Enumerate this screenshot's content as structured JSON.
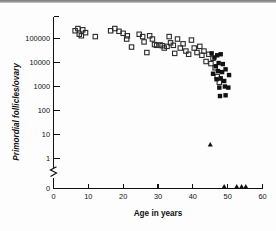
{
  "figure": {
    "background_color": "#fdfdfd",
    "ink_color": "#111111"
  },
  "chart_data": {
    "type": "scatter",
    "title": "",
    "xlabel": "Age in years",
    "ylabel": "Primordial follicles/ovary",
    "xlim": [
      0,
      60
    ],
    "ylim_log": [
      1,
      300000
    ],
    "yscale": "log",
    "grid": false,
    "legend": false,
    "axis_break": {
      "present": true,
      "between": [
        1,
        0
      ],
      "note": "y-axis broken below 1 to show a zero baseline"
    },
    "xticks": [
      0,
      10,
      20,
      30,
      40,
      50,
      60
    ],
    "xtick_labels": [
      "0",
      "10",
      "20",
      "30",
      "40",
      "50",
      "60"
    ],
    "yticks": [
      100000,
      10000,
      1000,
      100,
      10,
      1,
      0
    ],
    "ytick_labels": [
      "100000",
      "10000",
      "1000",
      "100",
      "10",
      "1",
      "0"
    ],
    "series": [
      {
        "name": "open-square",
        "marker": "open square",
        "marker_color": "#2b2b2b",
        "points": [
          [
            6.2,
            210000
          ],
          [
            7.4,
            150000
          ],
          [
            7.0,
            260000
          ],
          [
            8.4,
            230000
          ],
          [
            8.0,
            130000
          ],
          [
            9.2,
            175000
          ],
          [
            12.0,
            120000
          ],
          [
            16.4,
            210000
          ],
          [
            17.6,
            260000
          ],
          [
            18.8,
            200000
          ],
          [
            20.0,
            165000
          ],
          [
            21.2,
            130000
          ],
          [
            21.0,
            95000
          ],
          [
            22.4,
            44000
          ],
          [
            24.6,
            150000
          ],
          [
            25.6,
            120000
          ],
          [
            26.0,
            72000
          ],
          [
            26.8,
            26000
          ],
          [
            27.6,
            130000
          ],
          [
            28.4,
            95000
          ],
          [
            29.0,
            56000
          ],
          [
            29.6,
            52000
          ],
          [
            30.6,
            54000
          ],
          [
            31.2,
            50000
          ],
          [
            31.8,
            40000
          ],
          [
            32.6,
            47000
          ],
          [
            33.2,
            120000
          ],
          [
            33.6,
            66000
          ],
          [
            34.4,
            52000
          ],
          [
            34.8,
            24000
          ],
          [
            35.6,
            95000
          ],
          [
            36.4,
            40000
          ],
          [
            37.2,
            60000
          ],
          [
            38.0,
            30000
          ],
          [
            38.8,
            22000
          ],
          [
            39.6,
            86000
          ],
          [
            40.4,
            40000
          ],
          [
            41.2,
            26000
          ],
          [
            42.0,
            47000
          ],
          [
            42.6,
            20000
          ],
          [
            43.2,
            30000
          ],
          [
            43.8,
            11000
          ],
          [
            44.6,
            22000
          ],
          [
            45.2,
            9000
          ],
          [
            45.8,
            15000
          ],
          [
            46.4,
            6000
          ],
          [
            47.0,
            2600
          ],
          [
            47.6,
            1500
          ]
        ]
      },
      {
        "name": "filled-square",
        "marker": "filled square",
        "marker_color": "#111111",
        "points": [
          [
            45.4,
            24000
          ],
          [
            46.2,
            16000
          ],
          [
            47.0,
            20000
          ],
          [
            48.0,
            22000
          ],
          [
            46.6,
            7000
          ],
          [
            47.4,
            9500
          ],
          [
            48.6,
            8600
          ],
          [
            45.8,
            3400
          ],
          [
            47.2,
            4400
          ],
          [
            48.4,
            4000
          ],
          [
            49.4,
            5200
          ],
          [
            46.8,
            2000
          ],
          [
            48.0,
            2200
          ],
          [
            49.0,
            1700
          ],
          [
            47.6,
            900
          ],
          [
            49.2,
            1000
          ],
          [
            47.8,
            400
          ],
          [
            49.4,
            430
          ],
          [
            50.4,
            3000
          ],
          [
            50.2,
            900
          ]
        ]
      },
      {
        "name": "triangle",
        "marker": "filled triangle",
        "marker_color": "#111111",
        "points": [
          [
            45.0,
            3.2
          ],
          [
            49.0,
            0
          ],
          [
            52.6,
            0
          ],
          [
            54.0,
            0
          ],
          [
            55.2,
            0
          ]
        ]
      }
    ]
  }
}
